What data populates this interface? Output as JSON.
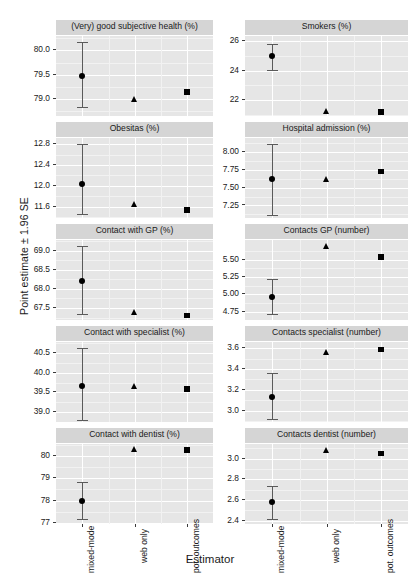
{
  "chart_data": {
    "type": "scatter",
    "title": "",
    "xlabel": "Estimator",
    "ylabel": "Point estimate ± 1.96 SE",
    "grid": true,
    "legend": "none",
    "layout": "2 columns × 5 rows of faceted panels",
    "categories": [
      "mixed-mode",
      "web only",
      "pot. outcomes"
    ],
    "markers": [
      "circle",
      "triangle",
      "square"
    ],
    "panels": [
      {
        "title": "(Very) good subjective health (%)",
        "col": 0,
        "row": 0,
        "ylim": [
          78.62,
          80.3
        ],
        "yticks": [
          79.0,
          79.5,
          80.0
        ],
        "ytick_labels": [
          "79.0",
          "79.5",
          "80.0"
        ],
        "yminor": [
          78.75,
          79.25,
          79.75,
          80.25
        ],
        "points": [
          {
            "estimator": "mixed-mode",
            "marker": "circle",
            "value": 79.48,
            "lo": 78.82,
            "hi": 80.18
          },
          {
            "estimator": "web only",
            "marker": "triangle",
            "value": 78.99,
            "lo": null,
            "hi": null
          },
          {
            "estimator": "pot. outcomes",
            "marker": "square",
            "value": 79.14,
            "lo": null,
            "hi": null
          }
        ]
      },
      {
        "title": "Smokers (%)",
        "col": 1,
        "row": 0,
        "ylim": [
          20.85,
          26.35
        ],
        "yticks": [
          22,
          24,
          26
        ],
        "ytick_labels": [
          "22",
          "24",
          "26"
        ],
        "yminor": [
          21,
          23,
          25
        ],
        "points": [
          {
            "estimator": "mixed-mode",
            "marker": "circle",
            "value": 25.02,
            "lo": 24.02,
            "hi": 25.82
          },
          {
            "estimator": "web only",
            "marker": "triangle",
            "value": 21.22,
            "lo": null,
            "hi": null
          },
          {
            "estimator": "pot. outcomes",
            "marker": "square",
            "value": 21.18,
            "lo": null,
            "hi": null
          }
        ]
      },
      {
        "title": "Obesitas (%)",
        "col": 0,
        "row": 1,
        "ylim": [
          11.36,
          12.92
        ],
        "yticks": [
          11.6,
          12.0,
          12.4,
          12.8
        ],
        "ytick_labels": [
          "11.6",
          "12.0",
          "12.4",
          "12.8"
        ],
        "yminor": [
          11.4,
          11.8,
          12.2,
          12.6
        ],
        "points": [
          {
            "estimator": "mixed-mode",
            "marker": "circle",
            "value": 12.03,
            "lo": 11.46,
            "hi": 12.81
          },
          {
            "estimator": "web only",
            "marker": "triangle",
            "value": 11.64,
            "lo": null,
            "hi": null
          },
          {
            "estimator": "pot. outcomes",
            "marker": "square",
            "value": 11.53,
            "lo": null,
            "hi": null
          }
        ]
      },
      {
        "title": "Hospital admission (%)",
        "col": 1,
        "row": 1,
        "ylim": [
          7.06,
          8.2
        ],
        "yticks": [
          7.25,
          7.5,
          7.75,
          8.0
        ],
        "ytick_labels": [
          "7.25",
          "7.50",
          "7.75",
          "8.00"
        ],
        "yminor": [
          7.125,
          7.375,
          7.625,
          7.875,
          8.125
        ],
        "points": [
          {
            "estimator": "mixed-mode",
            "marker": "circle",
            "value": 7.62,
            "lo": 7.11,
            "hi": 8.12
          },
          {
            "estimator": "web only",
            "marker": "triangle",
            "value": 7.62,
            "lo": null,
            "hi": null
          },
          {
            "estimator": "pot. outcomes",
            "marker": "square",
            "value": 7.73,
            "lo": null,
            "hi": null
          }
        ]
      },
      {
        "title": "Contact with GP (%)",
        "col": 0,
        "row": 2,
        "ylim": [
          67.16,
          69.28
        ],
        "yticks": [
          67.5,
          68.0,
          68.5,
          69.0
        ],
        "ytick_labels": [
          "67.5",
          "68.0",
          "68.5",
          "69.0"
        ],
        "yminor": [
          67.25,
          67.75,
          68.25,
          68.75,
          69.25
        ],
        "points": [
          {
            "estimator": "mixed-mode",
            "marker": "circle",
            "value": 68.21,
            "lo": 67.35,
            "hi": 69.11
          },
          {
            "estimator": "web only",
            "marker": "triangle",
            "value": 67.4,
            "lo": null,
            "hi": null
          },
          {
            "estimator": "pot. outcomes",
            "marker": "square",
            "value": 67.31,
            "lo": null,
            "hi": null
          }
        ]
      },
      {
        "title": "Contacts GP (number)",
        "col": 1,
        "row": 2,
        "ylim": [
          4.62,
          5.78
        ],
        "yticks": [
          4.75,
          5.0,
          5.25,
          5.5
        ],
        "ytick_labels": [
          "4.75",
          "5.00",
          "5.25",
          "5.50"
        ],
        "yminor": [
          4.625,
          4.875,
          5.125,
          5.375,
          5.625
        ],
        "points": [
          {
            "estimator": "mixed-mode",
            "marker": "circle",
            "value": 4.97,
            "lo": 4.72,
            "hi": 5.22
          },
          {
            "estimator": "web only",
            "marker": "triangle",
            "value": 5.69,
            "lo": null,
            "hi": null
          },
          {
            "estimator": "pot. outcomes",
            "marker": "square",
            "value": 5.54,
            "lo": null,
            "hi": null
          }
        ]
      },
      {
        "title": "Contact with specialist (%)",
        "col": 0,
        "row": 3,
        "ylim": [
          38.72,
          40.78
        ],
        "yticks": [
          39.0,
          39.5,
          40.0,
          40.5
        ],
        "ytick_labels": [
          "39.0",
          "39.5",
          "40.0",
          "40.5"
        ],
        "yminor": [
          38.75,
          39.25,
          39.75,
          40.25,
          40.75
        ],
        "points": [
          {
            "estimator": "mixed-mode",
            "marker": "circle",
            "value": 39.67,
            "lo": 38.8,
            "hi": 40.63
          },
          {
            "estimator": "web only",
            "marker": "triangle",
            "value": 39.65,
            "lo": null,
            "hi": null
          },
          {
            "estimator": "pot. outcomes",
            "marker": "square",
            "value": 39.58,
            "lo": null,
            "hi": null
          }
        ]
      },
      {
        "title": "Contacts specialist (number)",
        "col": 1,
        "row": 3,
        "ylim": [
          2.88,
          3.66
        ],
        "yticks": [
          3.0,
          3.2,
          3.4,
          3.6
        ],
        "ytick_labels": [
          "3.0",
          "3.2",
          "3.4",
          "3.6"
        ],
        "yminor": [
          2.9,
          3.1,
          3.3,
          3.5
        ],
        "points": [
          {
            "estimator": "mixed-mode",
            "marker": "circle",
            "value": 3.13,
            "lo": 2.92,
            "hi": 3.36
          },
          {
            "estimator": "web only",
            "marker": "triangle",
            "value": 3.56,
            "lo": null,
            "hi": null
          },
          {
            "estimator": "pot. outcomes",
            "marker": "square",
            "value": 3.59,
            "lo": null,
            "hi": null
          }
        ]
      },
      {
        "title": "Contact with dentist (%)",
        "col": 0,
        "row": 4,
        "ylim": [
          76.9,
          80.55
        ],
        "yticks": [
          77,
          78,
          79,
          80
        ],
        "ytick_labels": [
          "77",
          "78",
          "79",
          "80"
        ],
        "yminor": [
          76.5,
          77.5,
          78.5,
          79.5,
          80.5
        ],
        "points": [
          {
            "estimator": "mixed-mode",
            "marker": "circle",
            "value": 78.0,
            "lo": 77.18,
            "hi": 78.86
          },
          {
            "estimator": "web only",
            "marker": "triangle",
            "value": 80.3,
            "lo": null,
            "hi": null
          },
          {
            "estimator": "pot. outcomes",
            "marker": "square",
            "value": 80.28,
            "lo": null,
            "hi": null
          }
        ]
      },
      {
        "title": "Contacts dentist (number)",
        "col": 1,
        "row": 4,
        "ylim": [
          2.36,
          3.14
        ],
        "yticks": [
          2.4,
          2.6,
          2.8,
          3.0
        ],
        "ytick_labels": [
          "2.4",
          "2.6",
          "2.8",
          "3.0"
        ],
        "yminor": [
          2.3,
          2.5,
          2.7,
          2.9,
          3.1
        ],
        "points": [
          {
            "estimator": "mixed-mode",
            "marker": "circle",
            "value": 2.58,
            "lo": 2.42,
            "hi": 2.74
          },
          {
            "estimator": "web only",
            "marker": "triangle",
            "value": 3.08,
            "lo": null,
            "hi": null
          },
          {
            "estimator": "pot. outcomes",
            "marker": "square",
            "value": 3.05,
            "lo": null,
            "hi": null
          }
        ]
      }
    ],
    "style": {
      "panel_background": "#e6e6e6",
      "strip_background": "#d5d5d5",
      "major_grid_color": "#ffffff",
      "minor_grid_color": "#f2f2f2",
      "marker_color": "#000000",
      "errorbar_color": "#5a5a5a",
      "text_color": "#1a1a1a"
    }
  }
}
